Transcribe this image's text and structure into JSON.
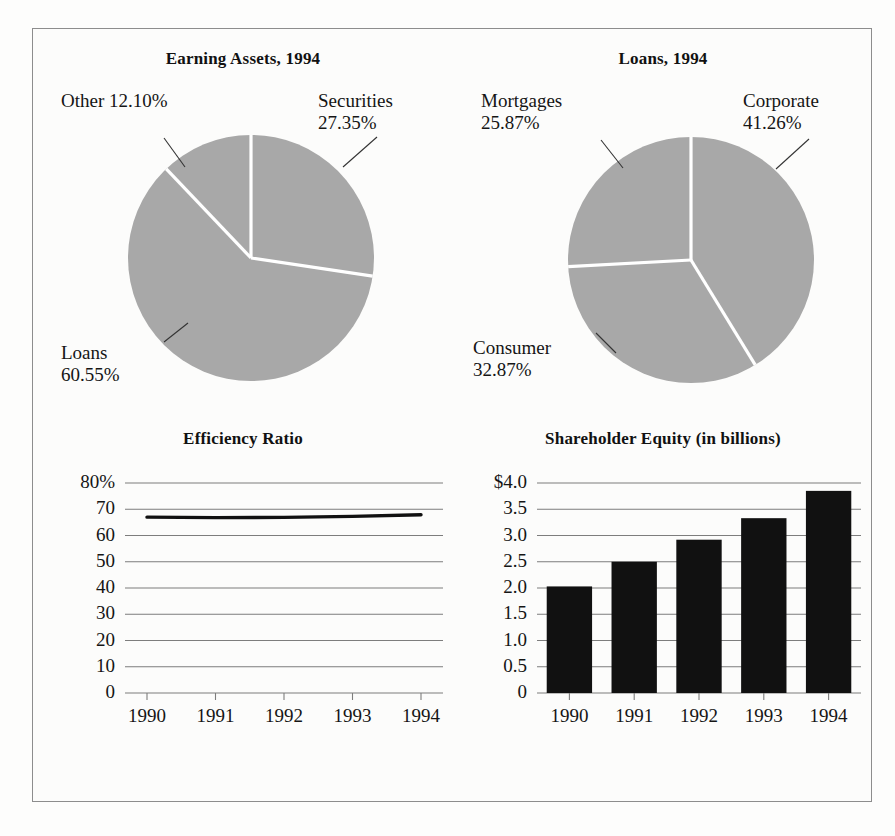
{
  "figure": {
    "background_color": "#fdfdfc",
    "frame_color": "#8d8d8d",
    "pie_slice_color": "#a8a8a8",
    "pie_divider_color": "#ffffff",
    "bar_color": "#111111",
    "gridline_color": "#7d7d7d",
    "line_color": "#111111"
  },
  "chart_data": [
    {
      "type": "pie",
      "id": "earning-assets",
      "title": "Earning Assets, 1994",
      "start_angle_deg": 90,
      "direction": "clockwise",
      "labels": [
        "Securities",
        "Loans",
        "Other"
      ],
      "values": [
        27.35,
        60.55,
        12.1
      ],
      "value_labels": [
        "27.35%",
        "60.55%",
        "12.10%"
      ],
      "callouts": [
        {
          "name": "securities",
          "text": "Securities\n27.35%"
        },
        {
          "name": "loans",
          "text": "Loans\n60.55%"
        },
        {
          "name": "other",
          "text": "Other 12.10%"
        }
      ],
      "legend": "none"
    },
    {
      "type": "pie",
      "id": "loans",
      "title": "Loans, 1994",
      "start_angle_deg": 90,
      "direction": "clockwise",
      "labels": [
        "Corporate",
        "Consumer",
        "Mortgages"
      ],
      "values": [
        41.26,
        32.87,
        25.87
      ],
      "value_labels": [
        "41.26%",
        "32.87%",
        "25.87%"
      ],
      "callouts": [
        {
          "name": "corporate",
          "text": "Corporate\n41.26%"
        },
        {
          "name": "consumer",
          "text": "Consumer\n32.87%"
        },
        {
          "name": "mortgages",
          "text": "Mortgages\n25.87%"
        }
      ],
      "legend": "none"
    },
    {
      "type": "line",
      "id": "efficiency-ratio",
      "title": "Efficiency Ratio",
      "xlabel": "",
      "ylabel": "",
      "categories": [
        "1990",
        "1991",
        "1992",
        "1993",
        "1994"
      ],
      "x": [
        1990,
        1991,
        1992,
        1993,
        1994
      ],
      "values": [
        67.0,
        66.8,
        66.9,
        67.3,
        67.9
      ],
      "ylim": [
        0,
        80
      ],
      "yticks": [
        0,
        10,
        20,
        30,
        40,
        50,
        60,
        70,
        80
      ],
      "ytick_labels": [
        "0",
        "10",
        "20",
        "30",
        "40",
        "50",
        "60",
        "70",
        "80%"
      ],
      "grid": true,
      "legend": "none"
    },
    {
      "type": "bar",
      "id": "shareholder-equity",
      "title": "Shareholder Equity (in billions)",
      "xlabel": "",
      "ylabel": "",
      "categories": [
        "1990",
        "1991",
        "1992",
        "1993",
        "1994"
      ],
      "values": [
        2.03,
        2.5,
        2.92,
        3.33,
        3.85
      ],
      "ylim": [
        0,
        4.0
      ],
      "yticks": [
        0,
        0.5,
        1.0,
        1.5,
        2.0,
        2.5,
        3.0,
        3.5,
        4.0
      ],
      "ytick_labels": [
        "0",
        "0.5",
        "1.0",
        "1.5",
        "2.0",
        "2.5",
        "3.0",
        "3.5",
        "$4.0"
      ],
      "grid": true,
      "legend": "none"
    }
  ]
}
